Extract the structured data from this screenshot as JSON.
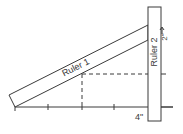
{
  "diagram": {
    "type": "geometry-measurement",
    "ruler1": {
      "label": "Ruler 1"
    },
    "ruler2": {
      "label": "Ruler 2"
    },
    "dimensions": {
      "vertical_label": "2\"",
      "horizontal_label": "4\""
    },
    "colors": {
      "line": "#3a3a3a",
      "background": "#ffffff"
    },
    "base_ticks": 5
  }
}
